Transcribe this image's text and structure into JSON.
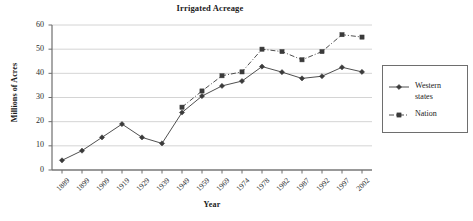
{
  "chart_data": {
    "type": "line",
    "title": "Irrigated Acreage",
    "xlabel": "Year",
    "ylabel": "Millions of Acres",
    "categories": [
      "1889",
      "1899",
      "1909",
      "1919",
      "1929",
      "1939",
      "1949",
      "1959",
      "1969",
      "1974",
      "1978",
      "1982",
      "1987",
      "1992",
      "1997",
      "2002"
    ],
    "ylim": [
      0,
      60
    ],
    "yticks": [
      0,
      10,
      20,
      30,
      40,
      50,
      60
    ],
    "grid": true,
    "legend_position": "right",
    "series": [
      {
        "name": "Western states",
        "legend_label_line1": "Western",
        "legend_label_line2": "states",
        "marker": "diamond",
        "linestyle": "solid",
        "color": "#3b3b3b",
        "values": [
          4,
          8,
          13.5,
          19,
          13.5,
          11,
          23.8,
          30.6,
          34.8,
          36.8,
          42.8,
          40.5,
          37.9,
          38.8,
          42.5,
          40.6
        ]
      },
      {
        "name": "Nation",
        "legend_label_line1": "Nation",
        "legend_label_line2": "",
        "marker": "square",
        "linestyle": "dashdot",
        "color": "#3b3b3b",
        "values": [
          null,
          null,
          null,
          null,
          null,
          null,
          26,
          32.7,
          39,
          40.6,
          50,
          49,
          45.6,
          49,
          56,
          55
        ]
      }
    ]
  }
}
